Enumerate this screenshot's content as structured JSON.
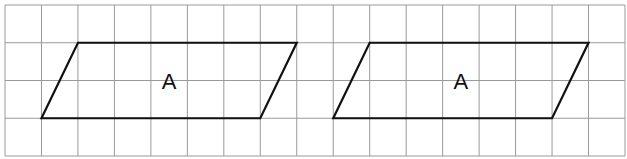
{
  "grid": {
    "columns": 17,
    "rows": 4,
    "origin_x": 5,
    "origin_y": 5,
    "cell_w": 36.47,
    "cell_h": 37.75,
    "line_color": "#9a9a9a"
  },
  "shapes": [
    {
      "type": "parallelogram",
      "label": "A",
      "vertices_grid": [
        [
          2,
          1
        ],
        [
          8,
          1
        ],
        [
          7,
          3
        ],
        [
          1,
          3
        ]
      ]
    },
    {
      "type": "parallelogram",
      "label": "A",
      "vertices_grid": [
        [
          10,
          1
        ],
        [
          16,
          1
        ],
        [
          15,
          3
        ],
        [
          9,
          3
        ]
      ]
    }
  ],
  "labels": {
    "shape_0": "A",
    "shape_1": "A"
  }
}
